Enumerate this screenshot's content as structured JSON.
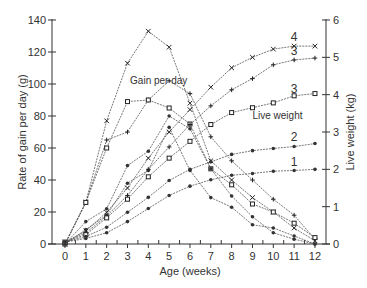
{
  "chart_data": {
    "type": "line",
    "title": "",
    "xlabel": "Age (weeks)",
    "ylabel": "Rate of gain per day (g)",
    "y2label": "Live weight (kg)",
    "x": [
      0,
      1,
      2,
      3,
      4,
      5,
      6,
      7,
      8,
      9,
      10,
      11,
      12
    ],
    "xlim": [
      0,
      12
    ],
    "ylim": [
      0,
      140
    ],
    "y2lim": [
      0,
      6
    ],
    "xticks": [
      "0",
      "1",
      "2",
      "3",
      "4",
      "5",
      "6",
      "7",
      "8",
      "9",
      "10",
      "11",
      "12"
    ],
    "yticks": [
      "0",
      "20",
      "40",
      "60",
      "80",
      "100",
      "120",
      "140"
    ],
    "y2ticks": [
      "0",
      "1",
      "2",
      "3",
      "4",
      "5",
      "6"
    ],
    "grid": false,
    "annotations": [
      {
        "text": "Gain per day",
        "x": 4.5,
        "y": 100
      },
      {
        "text": "Live weight",
        "x": 10.2,
        "y2": 3.35
      },
      {
        "text": "4",
        "x": 11.0,
        "y2": 5.45
      },
      {
        "text": "3",
        "x": 11.0,
        "y2": 5.05
      },
      {
        "text": "3",
        "x": 11.0,
        "y2": 4.05
      },
      {
        "text": "2",
        "x": 11.0,
        "y2": 2.75
      },
      {
        "text": "1",
        "x": 11.0,
        "y2": 2.1
      }
    ],
    "series": [
      {
        "name": "Gain per day 4",
        "axis": "left",
        "marker": "x",
        "values": [
          0,
          26,
          77,
          113,
          133,
          123,
          88,
          52,
          40,
          29,
          20,
          10,
          2
        ]
      },
      {
        "name": "Gain per day 3a",
        "axis": "left",
        "marker": "+",
        "values": [
          0,
          26,
          65,
          70,
          90,
          102,
          94,
          67,
          52,
          40,
          28,
          18,
          3
        ]
      },
      {
        "name": "Gain per day 3b",
        "axis": "left",
        "marker": "square",
        "values": [
          0,
          26,
          60,
          89,
          90,
          85,
          75,
          47,
          37,
          25,
          20,
          13,
          4
        ]
      },
      {
        "name": "Gain per day 2",
        "axis": "left",
        "marker": "dot",
        "values": [
          0,
          14,
          22,
          49,
          58,
          80,
          72,
          47,
          30,
          17,
          7,
          3,
          0
        ]
      },
      {
        "name": "Gain per day 1",
        "axis": "left",
        "marker": "dot",
        "values": [
          0,
          9,
          18,
          38,
          46,
          73,
          46,
          29,
          23,
          12,
          10,
          5,
          0
        ]
      },
      {
        "name": "Live weight 4",
        "axis": "right",
        "marker": "x",
        "values": [
          0.05,
          0.35,
          0.85,
          1.5,
          2.3,
          3.0,
          3.6,
          4.2,
          4.72,
          5.0,
          5.22,
          5.3,
          5.3
        ]
      },
      {
        "name": "Live weight 3a",
        "axis": "right",
        "marker": "+",
        "values": [
          0.05,
          0.3,
          0.75,
          1.3,
          2.0,
          2.6,
          3.2,
          3.7,
          4.13,
          4.43,
          4.8,
          4.93,
          4.98
        ]
      },
      {
        "name": "Live weight 3b",
        "axis": "right",
        "marker": "square",
        "values": [
          0.05,
          0.25,
          0.7,
          1.2,
          1.8,
          2.3,
          2.75,
          3.2,
          3.52,
          3.65,
          3.78,
          3.97,
          4.03
        ]
      },
      {
        "name": "Live weight 2",
        "axis": "right",
        "marker": "dot",
        "values": [
          0.05,
          0.2,
          0.45,
          0.85,
          1.25,
          1.7,
          2.0,
          2.2,
          2.4,
          2.5,
          2.56,
          2.61,
          2.69
        ]
      },
      {
        "name": "Live weight 1",
        "axis": "right",
        "marker": "dot",
        "values": [
          0.05,
          0.15,
          0.3,
          0.6,
          0.95,
          1.3,
          1.55,
          1.72,
          1.84,
          1.89,
          1.95,
          1.97,
          2.0
        ]
      }
    ]
  },
  "colors": {
    "line": "#555555",
    "axis": "#333333",
    "text": "#333333"
  }
}
